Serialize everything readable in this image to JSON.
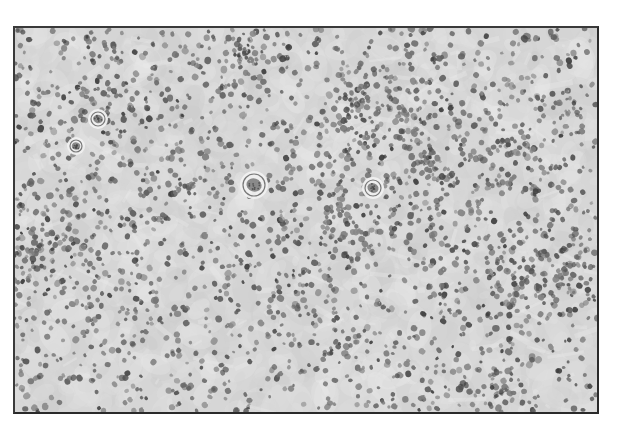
{
  "image": {
    "kind": "histology-micrograph",
    "grayscale": true,
    "background_color": "#d6d6d6",
    "nucleus_color_dark": "#4a4a4a",
    "nucleus_color_light": "#8a8a8a",
    "frame": {
      "x": 13,
      "y": 26,
      "width": 582,
      "height": 384
    },
    "cell_density": 2600,
    "large_cells": [
      {
        "x": 252,
        "y": 183,
        "r": 11,
        "label": "large-cell"
      },
      {
        "x": 371,
        "y": 186,
        "r": 8,
        "label": "large-cell"
      },
      {
        "x": 96,
        "y": 117,
        "r": 7,
        "label": "large-cell"
      },
      {
        "x": 74,
        "y": 144,
        "r": 6,
        "label": "large-cell"
      }
    ],
    "seed": 1337
  }
}
